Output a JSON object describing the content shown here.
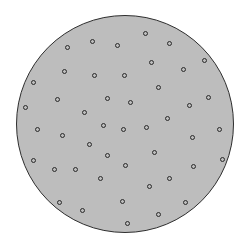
{
  "figure": {
    "width": 248,
    "height": 248,
    "background": "#ffffff",
    "disk": {
      "cx": 125,
      "cy": 124,
      "r": 109,
      "fill": "#bdbdbd",
      "stroke": "#2e2e2e",
      "stroke_width": 1.5
    },
    "dot_style": {
      "diameter": 5,
      "stroke": "#2a2a2a",
      "stroke_width": 1.3
    },
    "dots": [
      [
        145,
        33
      ],
      [
        169,
        43
      ],
      [
        67,
        47
      ],
      [
        92,
        41
      ],
      [
        117,
        45
      ],
      [
        204,
        60
      ],
      [
        151,
        62
      ],
      [
        183,
        69
      ],
      [
        64,
        71
      ],
      [
        94,
        75
      ],
      [
        124,
        75
      ],
      [
        33,
        82
      ],
      [
        158,
        87
      ],
      [
        208,
        97
      ],
      [
        107,
        98
      ],
      [
        57,
        99
      ],
      [
        130,
        102
      ],
      [
        189,
        105
      ],
      [
        25,
        107
      ],
      [
        84,
        112
      ],
      [
        167,
        118
      ],
      [
        103,
        125
      ],
      [
        146,
        127
      ],
      [
        123,
        129
      ],
      [
        37,
        129
      ],
      [
        219,
        129
      ],
      [
        62,
        135
      ],
      [
        192,
        137
      ],
      [
        89,
        144
      ],
      [
        154,
        152
      ],
      [
        107,
        155
      ],
      [
        33,
        160
      ],
      [
        222,
        159
      ],
      [
        125,
        165
      ],
      [
        54,
        169
      ],
      [
        75,
        169
      ],
      [
        193,
        166
      ],
      [
        169,
        178
      ],
      [
        100,
        178
      ],
      [
        149,
        186
      ],
      [
        59,
        202
      ],
      [
        122,
        201
      ],
      [
        185,
        202
      ],
      [
        82,
        210
      ],
      [
        158,
        214
      ],
      [
        127,
        223
      ]
    ]
  }
}
